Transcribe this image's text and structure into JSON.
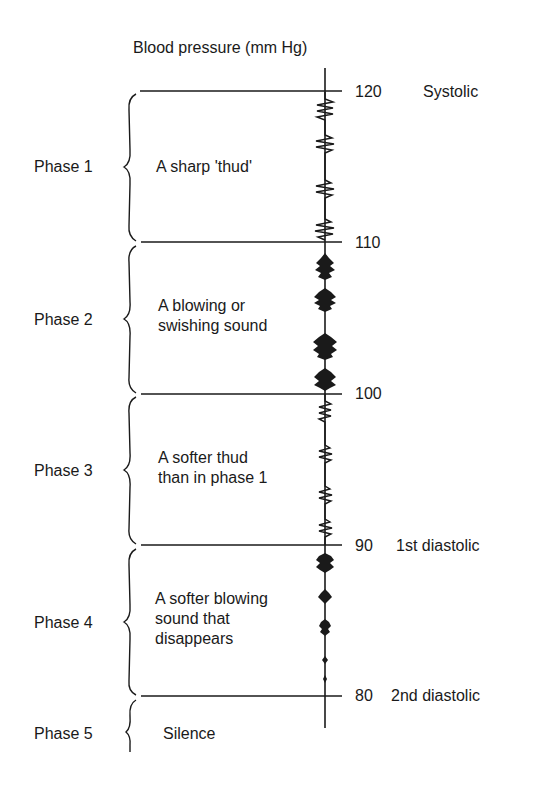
{
  "diagram": {
    "title": "Blood pressure (mm Hg)",
    "axis": {
      "ticks": [
        {
          "value": "120",
          "annotation": "Systolic"
        },
        {
          "value": "110",
          "annotation": ""
        },
        {
          "value": "100",
          "annotation": ""
        },
        {
          "value": "90",
          "annotation": "1st diastolic"
        },
        {
          "value": "80",
          "annotation": "2nd diastolic"
        }
      ]
    },
    "phases": [
      {
        "label": "Phase 1",
        "description": "A sharp 'thud'",
        "sound_glyph": "zigzag"
      },
      {
        "label": "Phase 2",
        "description": "A blowing or\nswishing sound",
        "sound_glyph": "burst"
      },
      {
        "label": "Phase 3",
        "description": "A softer thud\nthan in phase 1",
        "sound_glyph": "zigzag"
      },
      {
        "label": "Phase 4",
        "description": "A softer blowing\nsound that\ndisappears",
        "sound_glyph": "fading-burst"
      },
      {
        "label": "Phase 5",
        "description": "Silence",
        "sound_glyph": "none"
      }
    ]
  }
}
